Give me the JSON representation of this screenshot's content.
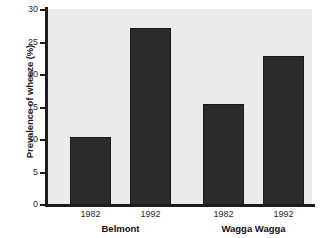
{
  "chart_data": {
    "type": "bar",
    "title": "",
    "xlabel": "",
    "ylabel": "Prevalence of wheeze (%)",
    "ylim": [
      0,
      30
    ],
    "ytick_values": [
      30,
      25,
      20,
      15,
      10,
      5,
      0
    ],
    "ytick_labels": [
      "30",
      "25",
      "20",
      "15",
      "10",
      "5",
      "0"
    ],
    "grid": false,
    "legend": "none",
    "bar_color": "#2b2b2b",
    "plot_background": "#ebebeb",
    "axis_color": "#1c1c1c",
    "categories": [
      "1982",
      "1992",
      "1982",
      "1992"
    ],
    "values": [
      10.5,
      27.3,
      15.5,
      23.0
    ],
    "groups": [
      {
        "label": "Belmont",
        "categories": [
          "1982",
          "1992"
        ],
        "values": [
          10.5,
          27.3
        ]
      },
      {
        "label": "Wagga Wagga",
        "categories": [
          "1982",
          "1992"
        ],
        "values": [
          15.5,
          23.0
        ]
      }
    ],
    "bars": [
      {
        "group": "Belmont",
        "category": "1982",
        "value": 10.5
      },
      {
        "group": "Belmont",
        "category": "1992",
        "value": 27.3
      },
      {
        "group": "Wagga Wagga",
        "category": "1982",
        "value": 15.5
      },
      {
        "group": "Wagga Wagga",
        "category": "1992",
        "value": 23.0
      }
    ]
  }
}
